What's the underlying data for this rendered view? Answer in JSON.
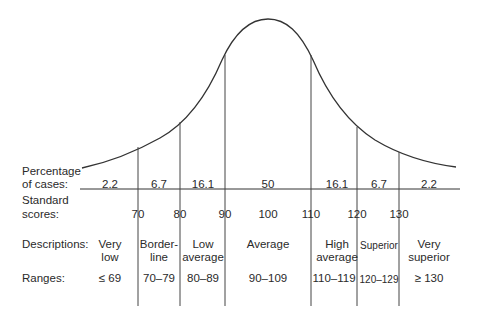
{
  "row_labels": {
    "percentage": [
      "Percentage",
      "of cases:"
    ],
    "standard": [
      "Standard",
      "scores:"
    ],
    "descriptions": "Descriptions:",
    "ranges": "Ranges:"
  },
  "percentages": [
    "2.2",
    "6.7",
    "16.1",
    "50",
    "16.1",
    "6.7",
    "2.2"
  ],
  "scores": [
    "70",
    "80",
    "90",
    "100",
    "110",
    "120",
    "130"
  ],
  "descriptions": [
    [
      "Very",
      "low"
    ],
    [
      "Border-",
      "line"
    ],
    [
      "Low",
      "average"
    ],
    [
      "Average",
      ""
    ],
    [
      "High",
      "average"
    ],
    [
      "Superior",
      ""
    ],
    [
      "Very",
      "superior"
    ]
  ],
  "ranges": [
    "≤ 69",
    "70–79",
    "80–89",
    "90–109",
    "110–119",
    "120–129",
    "≥ 130"
  ],
  "colors": {
    "line": "#333333",
    "text": "#2a2a2a"
  }
}
